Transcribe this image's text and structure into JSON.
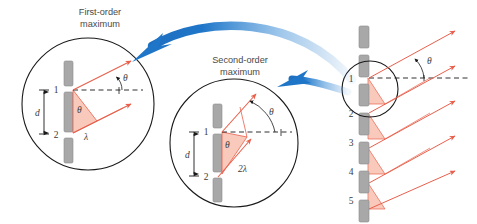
{
  "figure": {
    "title_first_order_line1": "First-order",
    "title_first_order_line2": "maximum",
    "title_second_order_line1": "Second-order",
    "title_second_order_line2": "maximum",
    "background_color": "#ffffff"
  },
  "colors": {
    "ray": "#e8604c",
    "ray_fill": "#f9c9bb",
    "slit": "#a8a8a8",
    "slit_edge": "#8c8c8c",
    "circle_outline": "#1a1a1a",
    "dashed_line": "#1a1a1a",
    "arrow_blue": "#1f76c8",
    "text": "#4a4a4a"
  },
  "callout_first_order": {
    "name": "first-order-maximum",
    "slit_labels": [
      "1",
      "2"
    ],
    "spacing_label": "d",
    "angle_label_ray": "θ",
    "angle_label_vertex": "θ",
    "path_difference_label": "λ"
  },
  "callout_second_order": {
    "name": "second-order-maximum",
    "slit_labels": [
      "1",
      "2"
    ],
    "spacing_label": "d",
    "angle_label_ray": "θ",
    "angle_label_vertex": "θ",
    "path_difference_label": "2λ"
  },
  "grating": {
    "name": "diffraction-grating",
    "slit_labels": [
      "1",
      "2",
      "3",
      "4",
      "5"
    ],
    "angle_label": "θ",
    "bar_count": 7
  },
  "annotations": {
    "arrow_to_first_order": "curved-arrow-to-first-order",
    "arrow_to_second_order": "curved-arrow-to-second-order"
  }
}
